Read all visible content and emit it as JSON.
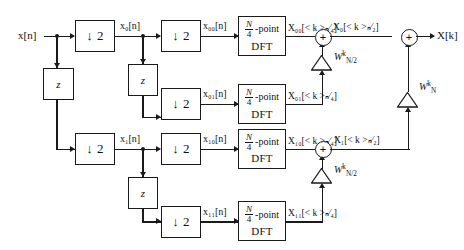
{
  "diagram": {
    "width": 464,
    "height": 250,
    "line_color": "#1a1a1a",
    "background": "#ffffff"
  },
  "input": {
    "label": "x[n]"
  },
  "output": {
    "label": "X[k]"
  },
  "downsamplers": [
    {
      "id": "ds-stage1-top",
      "label": "↓ 2"
    },
    {
      "id": "ds-stage2-top-0",
      "label": "↓ 2"
    },
    {
      "id": "ds-stage2-top-1",
      "label": "↓ 2"
    },
    {
      "id": "ds-stage1-bottom",
      "label": "↓ 2"
    },
    {
      "id": "ds-stage2-bottom-0",
      "label": "↓ 2"
    },
    {
      "id": "ds-stage2-bottom-1",
      "label": "↓ 2"
    }
  ],
  "delays": [
    {
      "id": "delay-stage1",
      "label": "z"
    },
    {
      "id": "delay-stage2-top",
      "label": "z"
    },
    {
      "id": "delay-stage2-bottom",
      "label": "z"
    }
  ],
  "dft_blocks": [
    {
      "id": "dft-00",
      "numerator": "N",
      "denominator": "4",
      "suffix": "-point",
      "line2": "DFT"
    },
    {
      "id": "dft-01",
      "numerator": "N",
      "denominator": "4",
      "suffix": "-point",
      "line2": "DFT"
    },
    {
      "id": "dft-10",
      "numerator": "N",
      "denominator": "4",
      "suffix": "-point",
      "line2": "DFT"
    },
    {
      "id": "dft-11",
      "numerator": "N",
      "denominator": "4",
      "suffix": "-point",
      "line2": "DFT"
    }
  ],
  "signal_labels": {
    "x0": "x₀[n]",
    "x1": "x₁[n]",
    "x00": "x₀₀[n]",
    "x01": "x₀₁[n]",
    "x10": "x₁₀[n]",
    "x11": "x₁₁[n]",
    "X00": "X₀₀[< k >ₙ⁄₄]",
    "X01": "X₀₁[< k >ₙ⁄₄]",
    "X10": "X₁₀[< k >ₙ⁄₄]",
    "X11": "X₁₁[< k >ₙ⁄₄]",
    "X0": "X₀[< k >ₙ⁄₂]",
    "X1": "X₁[< k >ₙ⁄₂]"
  },
  "twiddles": [
    {
      "id": "twiddle-top",
      "base": "W",
      "sub": "N/2",
      "sup": "k"
    },
    {
      "id": "twiddle-bottom",
      "base": "W",
      "sub": "N/2",
      "sup": "k"
    },
    {
      "id": "twiddle-final",
      "base": "W",
      "sub": "N",
      "sup": "k"
    }
  ],
  "adders": [
    {
      "id": "adder-top",
      "label": "+"
    },
    {
      "id": "adder-bottom",
      "label": "+"
    },
    {
      "id": "adder-final",
      "label": "+"
    }
  ]
}
